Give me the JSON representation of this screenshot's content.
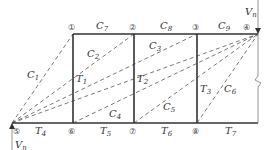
{
  "diagram": {
    "type": "truss-force-diagram",
    "nodes": [
      {
        "id": "1",
        "label": "①",
        "x": 73,
        "y": 34
      },
      {
        "id": "2",
        "label": "②",
        "x": 134,
        "y": 34
      },
      {
        "id": "3",
        "label": "③",
        "x": 197,
        "y": 34
      },
      {
        "id": "4",
        "label": "④",
        "x": 258,
        "y": 34
      },
      {
        "id": "5",
        "label": "⑤",
        "x": 12,
        "y": 123
      },
      {
        "id": "6",
        "label": "⑥",
        "x": 73,
        "y": 123
      },
      {
        "id": "7",
        "label": "⑦",
        "x": 134,
        "y": 123
      },
      {
        "id": "8",
        "label": "⑧",
        "x": 197,
        "y": 123
      }
    ],
    "top_chord_labels": [
      {
        "base": "C",
        "sub": "7"
      },
      {
        "base": "C",
        "sub": "8"
      },
      {
        "base": "C",
        "sub": "9"
      }
    ],
    "bottom_chord_labels": [
      {
        "base": "T",
        "sub": "4"
      },
      {
        "base": "T",
        "sub": "5"
      },
      {
        "base": "T",
        "sub": "6"
      },
      {
        "base": "T",
        "sub": "7"
      }
    ],
    "vertical_labels": [
      {
        "base": "T",
        "sub": "1"
      },
      {
        "base": "T",
        "sub": "2"
      },
      {
        "base": "T",
        "sub": "3"
      }
    ],
    "diagonal_labels": [
      {
        "base": "C",
        "sub": "1"
      },
      {
        "base": "C",
        "sub": "2"
      },
      {
        "base": "C",
        "sub": "3"
      },
      {
        "base": "C",
        "sub": "4"
      },
      {
        "base": "C",
        "sub": "5"
      },
      {
        "base": "C",
        "sub": "6"
      }
    ],
    "loads": [
      {
        "base": "V",
        "sub": "n",
        "position": "top-right"
      },
      {
        "base": "V",
        "sub": "n",
        "position": "bottom-left"
      }
    ]
  }
}
